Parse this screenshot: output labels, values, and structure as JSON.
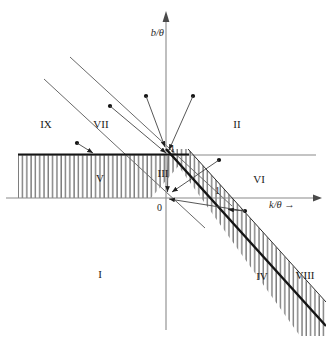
{
  "figure": {
    "type": "diagram",
    "background_color": "#ffffff",
    "line_color": "#555555",
    "bold_line_color": "#1a1a1a",
    "hatch_color": "#6b6b6b"
  },
  "axes": {
    "x_label": "k/θ →",
    "y_label": "b/θ",
    "origin_label": "0",
    "x_tick_label": "1",
    "y_tick_label": "1",
    "x_axis_y_px": 198,
    "y_axis_x_px": 166,
    "unit_px": 50
  },
  "regions": [
    {
      "id": "I",
      "label": "I",
      "x": 100,
      "y": 274
    },
    {
      "id": "II",
      "label": "II",
      "x": 237,
      "y": 124
    },
    {
      "id": "III",
      "label": "III",
      "x": 163,
      "y": 173
    },
    {
      "id": "IV",
      "label": "IV",
      "x": 262,
      "y": 276
    },
    {
      "id": "V",
      "label": "V",
      "x": 100,
      "y": 178
    },
    {
      "id": "VI",
      "label": "VI",
      "x": 259,
      "y": 179
    },
    {
      "id": "VII",
      "label": "VII",
      "x": 101,
      "y": 124
    },
    {
      "id": "VIII",
      "label": "VIII",
      "x": 305,
      "y": 275
    },
    {
      "id": "IX",
      "label": "IX",
      "x": 46,
      "y": 124
    }
  ],
  "hatched_areas": [
    {
      "name": "left-band",
      "note": "vertical hatching between y=0 and y=1 left of the bold diagonal"
    },
    {
      "name": "diagonal-band",
      "note": "vertical hatching inside the strip between the two bold parallel diagonals"
    }
  ],
  "lines": [
    {
      "name": "horizontal-unit-line",
      "note": "b/θ = 1 horizontal line across plot"
    },
    {
      "name": "bold-diagonal-main",
      "note": "steep bold diagonal through (0,1) and (1,0) continuing to lower right"
    },
    {
      "name": "bold-diagonal-lower",
      "note": "parallel bold diagonal offset below-right of main"
    },
    {
      "name": "thin-diagonal-upper",
      "note": "thin diagonal in upper-left, upper of the pair"
    },
    {
      "name": "thin-diagonal-lower",
      "note": "thin diagonal in upper-left, lower of the pair"
    }
  ],
  "vectors": [
    {
      "name": "arrow-a",
      "from": [
        146,
        96
      ],
      "to": [
        166,
        148
      ]
    },
    {
      "name": "arrow-b",
      "from": [
        193,
        96
      ],
      "to": [
        168,
        149
      ]
    },
    {
      "name": "arrow-c",
      "from": [
        110,
        106
      ],
      "to": [
        166,
        154
      ]
    },
    {
      "name": "arrow-d",
      "from": [
        77,
        143
      ],
      "to": [
        112,
        160
      ]
    },
    {
      "name": "arrow-e",
      "from": [
        219,
        160
      ],
      "to": [
        167,
        196
      ]
    },
    {
      "name": "arrow-f",
      "from": [
        245,
        211
      ],
      "to": [
        167,
        199
      ]
    },
    {
      "name": "arrow-g",
      "from": [
        168,
        155
      ],
      "to": [
        167,
        193
      ]
    }
  ]
}
